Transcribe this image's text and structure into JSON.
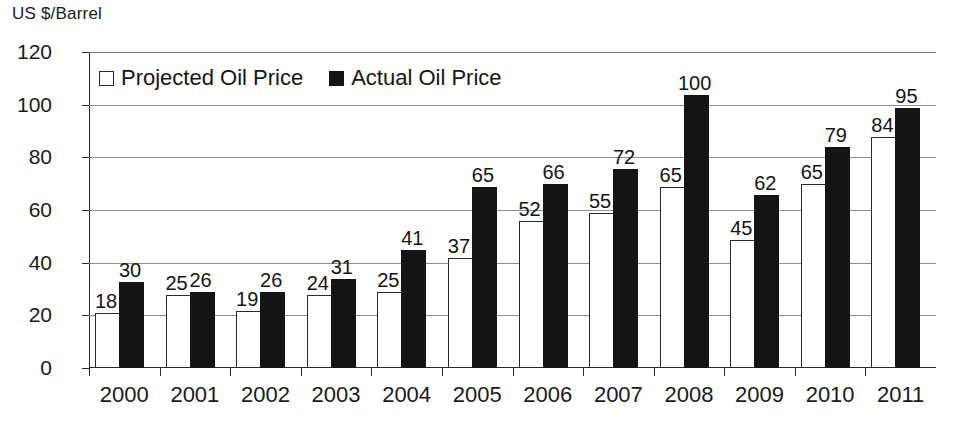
{
  "chart_data": {
    "type": "bar",
    "title": "US $/Barrel",
    "xlabel": "",
    "ylabel": "US $/Barrel",
    "ylim": [
      0,
      120
    ],
    "yticks": [
      0,
      20,
      40,
      60,
      80,
      100,
      120
    ],
    "grid": true,
    "legend_position": "top-left-inside",
    "categories": [
      "2000",
      "2001",
      "2002",
      "2003",
      "2004",
      "2005",
      "2006",
      "2007",
      "2008",
      "2009",
      "2010",
      "2011"
    ],
    "series": [
      {
        "name": "Projected Oil Price",
        "swatch": "open",
        "color": "#ffffff",
        "values": [
          18,
          25,
          19,
          24,
          25,
          37,
          52,
          55,
          65,
          45,
          65,
          84
        ],
        "bar_heights": [
          20,
          27,
          21,
          27,
          28,
          41,
          55,
          58,
          68,
          48,
          69,
          87
        ]
      },
      {
        "name": "Actual Oil Price",
        "swatch": "filled",
        "color": "#141414",
        "values": [
          30,
          26,
          26,
          31,
          41,
          65,
          66,
          72,
          100,
          62,
          79,
          95
        ],
        "bar_heights": [
          32,
          28,
          28,
          33,
          44,
          68,
          69,
          75,
          103,
          65,
          83,
          98
        ]
      }
    ]
  },
  "legend": {
    "items": [
      {
        "label": "Projected Oil Price",
        "swatch": "open"
      },
      {
        "label": "Actual Oil Price",
        "swatch": "filled"
      }
    ]
  },
  "colors": {
    "projected": "#ffffff",
    "actual": "#141414",
    "axis": "#2b2b2b",
    "grid": "#8d8d8d",
    "text": "#1a1a1a",
    "background": "#ffffff"
  }
}
